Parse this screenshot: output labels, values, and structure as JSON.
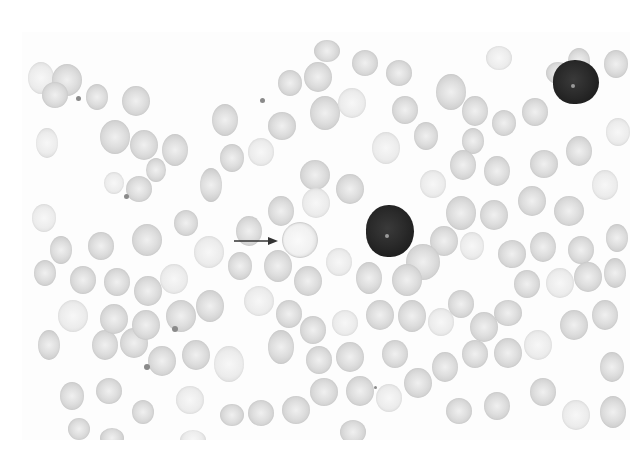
{
  "image": {
    "description": "Grayscale peripheral blood smear micrograph",
    "frame": {
      "x": 22,
      "y": 32,
      "width": 608,
      "height": 408
    },
    "colors": {
      "background": "#fdfdfd",
      "rbc": "#d6d6d6",
      "lymphocyte": "#222222",
      "arrow": "#333333"
    },
    "annotation": {
      "type": "arrow",
      "from": [
        234,
        240
      ],
      "to": [
        278,
        240
      ],
      "target": "pale-spherocyte-cell"
    },
    "lymphocytes": [
      {
        "x": 553,
        "y": 60,
        "w": 46,
        "h": 44
      },
      {
        "x": 366,
        "y": 205,
        "w": 48,
        "h": 52
      }
    ],
    "highlighted_cell": {
      "x": 282,
      "y": 222,
      "w": 34,
      "h": 34
    },
    "rbcs": [
      [
        28,
        62,
        26,
        32
      ],
      [
        52,
        64,
        30,
        32
      ],
      [
        42,
        82,
        26,
        26
      ],
      [
        86,
        84,
        22,
        26
      ],
      [
        122,
        86,
        28,
        30
      ],
      [
        36,
        128,
        22,
        30
      ],
      [
        100,
        120,
        30,
        34
      ],
      [
        130,
        130,
        28,
        30
      ],
      [
        162,
        134,
        26,
        32
      ],
      [
        200,
        168,
        22,
        34
      ],
      [
        104,
        172,
        20,
        22
      ],
      [
        126,
        176,
        26,
        26
      ],
      [
        146,
        158,
        20,
        24
      ],
      [
        212,
        104,
        26,
        32
      ],
      [
        220,
        144,
        24,
        28
      ],
      [
        248,
        138,
        26,
        28
      ],
      [
        268,
        112,
        28,
        28
      ],
      [
        278,
        70,
        24,
        26
      ],
      [
        304,
        62,
        28,
        30
      ],
      [
        310,
        96,
        30,
        34
      ],
      [
        338,
        88,
        28,
        30
      ],
      [
        352,
        50,
        26,
        26
      ],
      [
        314,
        40,
        26,
        22
      ],
      [
        386,
        60,
        26,
        26
      ],
      [
        392,
        96,
        26,
        28
      ],
      [
        372,
        132,
        28,
        32
      ],
      [
        414,
        122,
        24,
        28
      ],
      [
        336,
        174,
        28,
        30
      ],
      [
        300,
        160,
        30,
        30
      ],
      [
        268,
        196,
        26,
        30
      ],
      [
        302,
        188,
        28,
        30
      ],
      [
        436,
        74,
        30,
        36
      ],
      [
        462,
        96,
        26,
        30
      ],
      [
        462,
        128,
        22,
        26
      ],
      [
        492,
        110,
        24,
        26
      ],
      [
        486,
        46,
        26,
        24
      ],
      [
        522,
        98,
        26,
        28
      ],
      [
        546,
        62,
        24,
        22
      ],
      [
        568,
        48,
        22,
        26
      ],
      [
        604,
        50,
        24,
        28
      ],
      [
        606,
        118,
        24,
        28
      ],
      [
        566,
        136,
        26,
        30
      ],
      [
        530,
        150,
        28,
        28
      ],
      [
        484,
        156,
        26,
        30
      ],
      [
        450,
        150,
        26,
        30
      ],
      [
        420,
        170,
        26,
        28
      ],
      [
        446,
        196,
        30,
        34
      ],
      [
        480,
        200,
        28,
        30
      ],
      [
        518,
        186,
        28,
        30
      ],
      [
        554,
        196,
        30,
        30
      ],
      [
        592,
        170,
        26,
        30
      ],
      [
        606,
        224,
        22,
        28
      ],
      [
        568,
        236,
        26,
        28
      ],
      [
        530,
        232,
        26,
        30
      ],
      [
        498,
        240,
        28,
        28
      ],
      [
        460,
        232,
        24,
        28
      ],
      [
        430,
        226,
        28,
        30
      ],
      [
        406,
        244,
        34,
        36
      ],
      [
        392,
        264,
        30,
        32
      ],
      [
        356,
        262,
        26,
        32
      ],
      [
        326,
        248,
        26,
        28
      ],
      [
        294,
        266,
        28,
        30
      ],
      [
        264,
        250,
        28,
        32
      ],
      [
        236,
        216,
        26,
        30
      ],
      [
        228,
        252,
        24,
        28
      ],
      [
        244,
        286,
        30,
        30
      ],
      [
        276,
        300,
        26,
        28
      ],
      [
        268,
        330,
        26,
        34
      ],
      [
        300,
        316,
        26,
        28
      ],
      [
        306,
        346,
        26,
        28
      ],
      [
        332,
        310,
        26,
        26
      ],
      [
        336,
        342,
        28,
        30
      ],
      [
        366,
        300,
        28,
        30
      ],
      [
        382,
        340,
        26,
        28
      ],
      [
        398,
        300,
        28,
        32
      ],
      [
        428,
        308,
        26,
        28
      ],
      [
        448,
        290,
        26,
        28
      ],
      [
        470,
        312,
        28,
        30
      ],
      [
        494,
        300,
        28,
        26
      ],
      [
        514,
        270,
        26,
        28
      ],
      [
        546,
        268,
        28,
        30
      ],
      [
        574,
        262,
        28,
        30
      ],
      [
        604,
        258,
        22,
        30
      ],
      [
        592,
        300,
        26,
        30
      ],
      [
        560,
        310,
        28,
        30
      ],
      [
        524,
        330,
        28,
        30
      ],
      [
        494,
        338,
        28,
        30
      ],
      [
        462,
        340,
        26,
        28
      ],
      [
        432,
        352,
        26,
        30
      ],
      [
        404,
        368,
        28,
        30
      ],
      [
        376,
        384,
        26,
        28
      ],
      [
        346,
        376,
        28,
        30
      ],
      [
        310,
        378,
        28,
        28
      ],
      [
        282,
        396,
        28,
        28
      ],
      [
        248,
        400,
        26,
        26
      ],
      [
        214,
        346,
        30,
        36
      ],
      [
        182,
        340,
        28,
        30
      ],
      [
        148,
        346,
        28,
        30
      ],
      [
        120,
        328,
        28,
        30
      ],
      [
        92,
        330,
        26,
        30
      ],
      [
        58,
        300,
        30,
        32
      ],
      [
        38,
        330,
        22,
        30
      ],
      [
        70,
        266,
        26,
        28
      ],
      [
        104,
        268,
        26,
        28
      ],
      [
        134,
        276,
        28,
        30
      ],
      [
        160,
        264,
        28,
        30
      ],
      [
        166,
        300,
        30,
        32
      ],
      [
        132,
        310,
        28,
        30
      ],
      [
        100,
        304,
        28,
        30
      ],
      [
        196,
        290,
        28,
        32
      ],
      [
        32,
        204,
        24,
        28
      ],
      [
        50,
        236,
        22,
        28
      ],
      [
        88,
        232,
        26,
        28
      ],
      [
        132,
        224,
        30,
        32
      ],
      [
        174,
        210,
        24,
        26
      ],
      [
        194,
        236,
        30,
        32
      ],
      [
        34,
        260,
        22,
        26
      ],
      [
        60,
        382,
        24,
        28
      ],
      [
        96,
        378,
        26,
        26
      ],
      [
        132,
        400,
        22,
        24
      ],
      [
        176,
        386,
        28,
        28
      ],
      [
        220,
        404,
        24,
        22
      ],
      [
        446,
        398,
        26,
        26
      ],
      [
        484,
        392,
        26,
        28
      ],
      [
        530,
        378,
        26,
        28
      ],
      [
        562,
        400,
        28,
        30
      ],
      [
        600,
        352,
        24,
        30
      ],
      [
        600,
        396,
        26,
        32
      ],
      [
        440,
        440,
        30,
        22
      ],
      [
        340,
        420,
        26,
        24
      ],
      [
        180,
        430,
        26,
        20
      ],
      [
        100,
        428,
        24,
        20
      ],
      [
        68,
        418,
        22,
        22
      ]
    ],
    "platelets": [
      [
        76,
        96,
        5
      ],
      [
        260,
        98,
        5
      ],
      [
        124,
        194,
        5
      ],
      [
        172,
        326,
        6
      ],
      [
        144,
        364,
        6
      ],
      [
        374,
        386,
        3
      ]
    ]
  }
}
